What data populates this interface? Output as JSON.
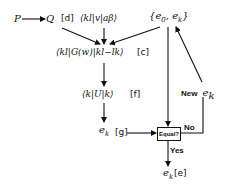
{
  "diagram": {
    "nodes": {
      "p": {
        "text": "P"
      },
      "q": {
        "text": "Q"
      },
      "d_tag": {
        "text": "[d]"
      },
      "matrix_v": {
        "text": "⟨kl|v|aβ⟩"
      },
      "energies": {
        "open": "{",
        "e0_base": "e",
        "e0_sub": "0",
        "sep": ", ",
        "ek_base": "e",
        "ek_sub": "k",
        "close": "}"
      },
      "matrix_g": {
        "text": "⟨kl|G(w)|kl−lk⟩"
      },
      "c_tag": {
        "text": "[c]"
      },
      "matrix_u": {
        "text": "⟨k|U|k⟩"
      },
      "f_tag": {
        "text": "[f]"
      },
      "ek_mid": {
        "base": "e",
        "sub": "k"
      },
      "g_tag": {
        "text": "[g]"
      },
      "equal_box": {
        "text": "Equal?"
      },
      "ek_final": {
        "base": "e",
        "sub": "k"
      },
      "e_tag": {
        "text": "[e]"
      }
    },
    "edge_labels": {
      "no": "No",
      "yes": "Yes",
      "new_prefix": "New",
      "new_base": "e",
      "new_sub": "k"
    },
    "colors": {
      "ink": "#111111",
      "background": "#ffffff"
    }
  }
}
